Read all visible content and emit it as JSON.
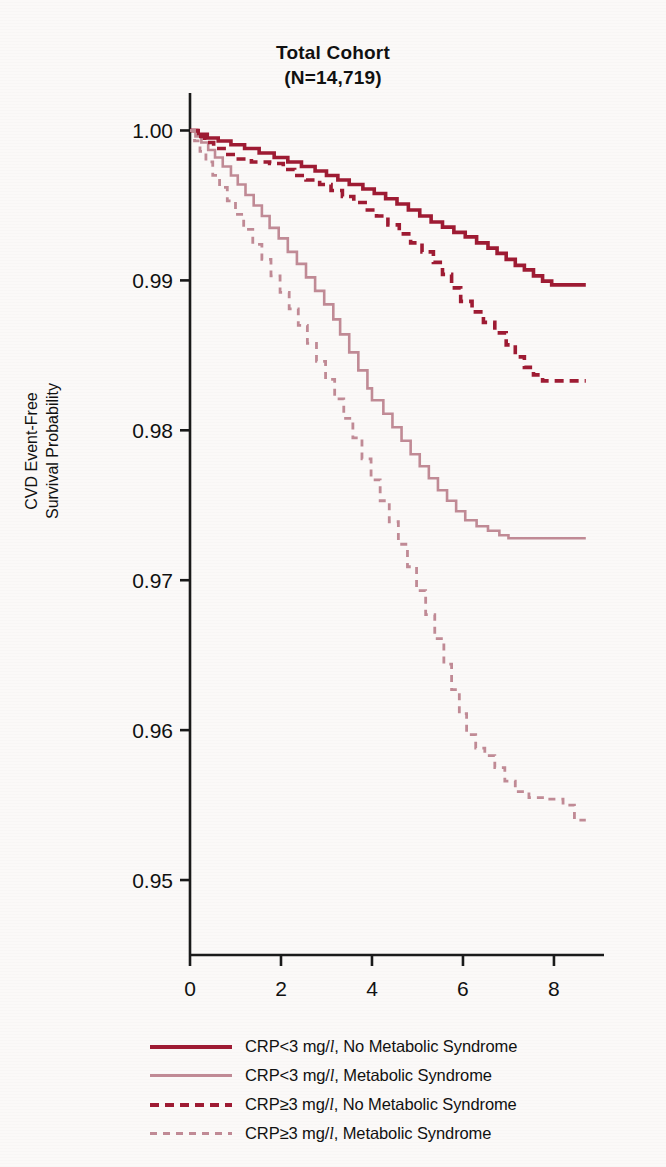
{
  "figure": {
    "title_line1": "Total Cohort",
    "title_line2": "(N=14,719)",
    "ylabel_line1": "CVD Event-Free",
    "ylabel_line2": "Survival Probability"
  },
  "legend": {
    "items": [
      {
        "label_prefix": "CRP<3 mg/",
        "unit": "l",
        "label_suffix": ", No Metabolic Syndrome",
        "style": "solid-dark",
        "color": "#9e1b33"
      },
      {
        "label_prefix": "CRP<3 mg/",
        "unit": "l",
        "label_suffix": ", Metabolic Syndrome",
        "style": "solid-light",
        "color": "#c08a95"
      },
      {
        "label_prefix": "CRP≥3 mg/",
        "unit": "l",
        "label_suffix": ", No Metabolic Syndrome",
        "style": "dash-dark",
        "color": "#9e1b33"
      },
      {
        "label_prefix": "CRP≥3 mg/",
        "unit": "l",
        "label_suffix": ", Metabolic Syndrome",
        "style": "dash-light",
        "color": "#c08a95"
      }
    ]
  },
  "chart_data": {
    "type": "line",
    "subtype": "kaplan-meier-step",
    "title": "Total Cohort (N=14,719)",
    "xlabel": "",
    "ylabel": "CVD Event-Free Survival Probability",
    "xlim": [
      0,
      9.1
    ],
    "ylim": [
      0.945,
      1.0025
    ],
    "xticks": [
      0,
      2,
      4,
      6,
      8
    ],
    "xticklabels": [
      "0",
      "2",
      "4",
      "6",
      "8"
    ],
    "yticks": [
      0.95,
      0.96,
      0.97,
      0.98,
      0.99,
      1.0
    ],
    "yticklabels": [
      "0.95",
      "0.96",
      "0.97",
      "0.98",
      "0.99",
      "1.00"
    ],
    "grid": false,
    "legend_position": "below",
    "axis_color": "#1a1a1a",
    "series": [
      {
        "name": "CRP<3 mg/l, No Metabolic Syndrome",
        "color": "#9e1b33",
        "dash": "solid",
        "width": 3.6,
        "points": [
          [
            0.0,
            1.0
          ],
          [
            0.18,
            0.99975
          ],
          [
            0.38,
            0.9995
          ],
          [
            0.62,
            0.9993
          ],
          [
            0.9,
            0.99905
          ],
          [
            1.2,
            0.9988
          ],
          [
            1.52,
            0.9985
          ],
          [
            1.85,
            0.9982
          ],
          [
            2.15,
            0.9979
          ],
          [
            2.45,
            0.9976
          ],
          [
            2.75,
            0.9973
          ],
          [
            3.0,
            0.997
          ],
          [
            3.25,
            0.9967
          ],
          [
            3.5,
            0.9964
          ],
          [
            3.8,
            0.9961
          ],
          [
            4.05,
            0.9958
          ],
          [
            4.3,
            0.99545
          ],
          [
            4.55,
            0.9951
          ],
          [
            4.8,
            0.9947
          ],
          [
            5.05,
            0.9943
          ],
          [
            5.3,
            0.9939
          ],
          [
            5.55,
            0.99355
          ],
          [
            5.8,
            0.9932
          ],
          [
            6.05,
            0.9929
          ],
          [
            6.3,
            0.9925
          ],
          [
            6.55,
            0.99215
          ],
          [
            6.75,
            0.9918
          ],
          [
            6.95,
            0.9914
          ],
          [
            7.15,
            0.991
          ],
          [
            7.35,
            0.9907
          ],
          [
            7.55,
            0.9903
          ],
          [
            7.75,
            0.98995
          ],
          [
            7.95,
            0.9897
          ],
          [
            8.7,
            0.9897
          ]
        ]
      },
      {
        "name": "CRP<3 mg/l, Metabolic Syndrome",
        "color": "#c08a95",
        "dash": "solid",
        "width": 2.6,
        "points": [
          [
            0.0,
            1.0
          ],
          [
            0.12,
            0.9996
          ],
          [
            0.25,
            0.9992
          ],
          [
            0.4,
            0.9987
          ],
          [
            0.55,
            0.9982
          ],
          [
            0.72,
            0.9976
          ],
          [
            0.9,
            0.997
          ],
          [
            1.05,
            0.9964
          ],
          [
            1.22,
            0.9957
          ],
          [
            1.4,
            0.995
          ],
          [
            1.58,
            0.9943
          ],
          [
            1.75,
            0.9935
          ],
          [
            1.95,
            0.9928
          ],
          [
            2.15,
            0.9919
          ],
          [
            2.35,
            0.9911
          ],
          [
            2.55,
            0.9902
          ],
          [
            2.75,
            0.9893
          ],
          [
            2.95,
            0.9884
          ],
          [
            3.15,
            0.9874
          ],
          [
            3.3,
            0.9864
          ],
          [
            3.5,
            0.9852
          ],
          [
            3.7,
            0.984
          ],
          [
            3.9,
            0.9828
          ],
          [
            4.0,
            0.982
          ],
          [
            4.25,
            0.9811
          ],
          [
            4.45,
            0.9802
          ],
          [
            4.65,
            0.9793
          ],
          [
            4.85,
            0.9784
          ],
          [
            5.05,
            0.9776
          ],
          [
            5.25,
            0.9768
          ],
          [
            5.45,
            0.976
          ],
          [
            5.65,
            0.9753
          ],
          [
            5.85,
            0.9746
          ],
          [
            6.05,
            0.974
          ],
          [
            6.3,
            0.9736
          ],
          [
            6.55,
            0.9733
          ],
          [
            6.8,
            0.973
          ],
          [
            7.0,
            0.9728
          ],
          [
            8.7,
            0.9728
          ]
        ]
      },
      {
        "name": "CRP>=3 mg/l, No Metabolic Syndrome",
        "color": "#9e1b33",
        "dash": "dashed",
        "width": 3.6,
        "points": [
          [
            0.0,
            1.0
          ],
          [
            0.15,
            0.9996
          ],
          [
            0.32,
            0.9992
          ],
          [
            0.52,
            0.9988
          ],
          [
            0.75,
            0.9984
          ],
          [
            1.0,
            0.9981
          ],
          [
            1.35,
            0.9979
          ],
          [
            1.75,
            0.9978
          ],
          [
            2.05,
            0.9974
          ],
          [
            2.3,
            0.997
          ],
          [
            2.55,
            0.9967
          ],
          [
            2.85,
            0.9964
          ],
          [
            3.1,
            0.996
          ],
          [
            3.35,
            0.9956
          ],
          [
            3.6,
            0.9952
          ],
          [
            3.85,
            0.9947
          ],
          [
            4.1,
            0.9943
          ],
          [
            4.35,
            0.9937
          ],
          [
            4.6,
            0.9931
          ],
          [
            4.85,
            0.9925
          ],
          [
            5.1,
            0.9919
          ],
          [
            5.35,
            0.9912
          ],
          [
            5.55,
            0.9904
          ],
          [
            5.75,
            0.9895
          ],
          [
            5.95,
            0.9886
          ],
          [
            6.2,
            0.9879
          ],
          [
            6.45,
            0.9872
          ],
          [
            6.7,
            0.9865
          ],
          [
            6.95,
            0.9857
          ],
          [
            7.15,
            0.9849
          ],
          [
            7.35,
            0.9842
          ],
          [
            7.55,
            0.9837
          ],
          [
            7.75,
            0.9833
          ],
          [
            8.7,
            0.9833
          ]
        ]
      },
      {
        "name": "CRP>=3 mg/l, Metabolic Syndrome",
        "color": "#c08a95",
        "dash": "dashed",
        "width": 2.8,
        "points": [
          [
            0.0,
            1.0
          ],
          [
            0.1,
            0.9993
          ],
          [
            0.22,
            0.9986
          ],
          [
            0.35,
            0.9979
          ],
          [
            0.5,
            0.997
          ],
          [
            0.65,
            0.9962
          ],
          [
            0.82,
            0.9953
          ],
          [
            1.0,
            0.9944
          ],
          [
            1.18,
            0.9934
          ],
          [
            1.38,
            0.9924
          ],
          [
            1.58,
            0.9914
          ],
          [
            1.78,
            0.9903
          ],
          [
            1.98,
            0.9892
          ],
          [
            2.18,
            0.9881
          ],
          [
            2.38,
            0.987
          ],
          [
            2.58,
            0.9858
          ],
          [
            2.78,
            0.9846
          ],
          [
            2.98,
            0.9834
          ],
          [
            3.18,
            0.9821
          ],
          [
            3.38,
            0.9808
          ],
          [
            3.58,
            0.9795
          ],
          [
            3.78,
            0.9781
          ],
          [
            3.98,
            0.9767
          ],
          [
            4.18,
            0.9753
          ],
          [
            4.38,
            0.9739
          ],
          [
            4.58,
            0.9724
          ],
          [
            4.78,
            0.9709
          ],
          [
            4.98,
            0.9693
          ],
          [
            5.18,
            0.9677
          ],
          [
            5.38,
            0.9661
          ],
          [
            5.58,
            0.9644
          ],
          [
            5.75,
            0.9627
          ],
          [
            5.92,
            0.9611
          ],
          [
            6.08,
            0.9597
          ],
          [
            6.28,
            0.9588
          ],
          [
            6.48,
            0.9583
          ],
          [
            6.7,
            0.9575
          ],
          [
            6.92,
            0.9566
          ],
          [
            7.15,
            0.9559
          ],
          [
            7.45,
            0.9555
          ],
          [
            7.85,
            0.9554
          ],
          [
            8.2,
            0.955
          ],
          [
            8.45,
            0.954
          ],
          [
            8.7,
            0.954
          ]
        ]
      }
    ]
  }
}
